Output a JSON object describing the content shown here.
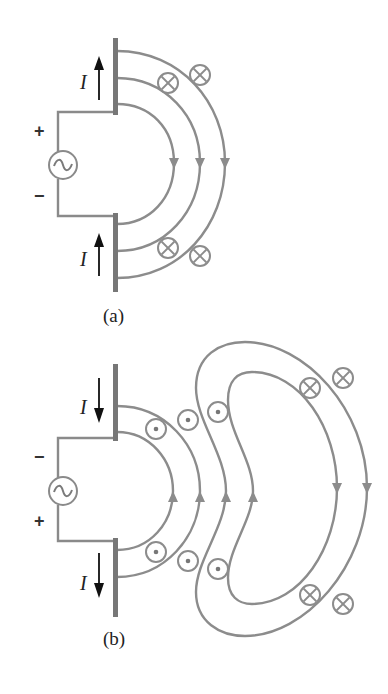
{
  "figure": {
    "panels": [
      {
        "id": "a",
        "caption": "(a)",
        "current_label": "I",
        "current_direction": "up",
        "source_top_sign": "+",
        "source_bottom_sign": "−",
        "source_symbol": "ac-source",
        "field_arrow_direction": "down",
        "field_lines": 3,
        "upper_symbols": [
          "into-page",
          "into-page"
        ],
        "lower_symbols": [
          "into-page",
          "into-page"
        ]
      },
      {
        "id": "b",
        "caption": "(b)",
        "current_label": "I",
        "current_direction": "down",
        "source_top_sign": "−",
        "source_bottom_sign": "+",
        "source_symbol": "ac-source",
        "field_arrow_direction_near": "up",
        "field_arrow_direction_far": "down",
        "field_lines_near": 2,
        "detached_loops": 2,
        "upper_symbols": [
          "out-of-page",
          "out-of-page",
          "out-of-page",
          "into-page",
          "into-page"
        ],
        "lower_symbols": [
          "out-of-page",
          "out-of-page",
          "out-of-page",
          "into-page",
          "into-page"
        ]
      }
    ],
    "colors": {
      "field_line": "#8c8c8c",
      "antenna_rod": "#777777",
      "current_arrow": "#111111",
      "background": "#ffffff"
    }
  }
}
